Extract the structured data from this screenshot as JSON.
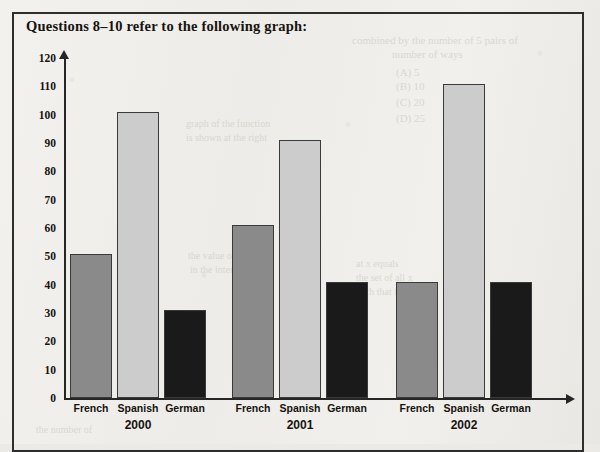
{
  "figure": {
    "title": "Questions 8–10 refer to the following graph:"
  },
  "bleed_text": [
    {
      "text": "combined by the number of 5 pairs of",
      "x": 352,
      "y": 34,
      "size": 11
    },
    {
      "text": "number of ways",
      "x": 392,
      "y": 48,
      "size": 11
    },
    {
      "text": "(A) 5",
      "x": 396,
      "y": 66,
      "size": 11
    },
    {
      "text": "(B) 10",
      "x": 396,
      "y": 80,
      "size": 11
    },
    {
      "text": "(C) 20",
      "x": 396,
      "y": 96,
      "size": 11
    },
    {
      "text": "(D) 25",
      "x": 396,
      "y": 112,
      "size": 11
    },
    {
      "text": "graph of the function",
      "x": 186,
      "y": 118,
      "size": 10
    },
    {
      "text": "is shown at the right",
      "x": 186,
      "y": 132,
      "size": 10
    },
    {
      "text": "the value of x",
      "x": 188,
      "y": 250,
      "size": 10
    },
    {
      "text": "in the interval",
      "x": 190,
      "y": 264,
      "size": 10
    },
    {
      "text": "at x equals",
      "x": 356,
      "y": 258,
      "size": 10
    },
    {
      "text": "the set of all x",
      "x": 356,
      "y": 272,
      "size": 10
    },
    {
      "text": "such that f of x",
      "x": 356,
      "y": 286,
      "size": 10
    },
    {
      "text": "the number of",
      "x": 36,
      "y": 424,
      "size": 10
    }
  ],
  "chart_data": {
    "type": "bar",
    "title": "",
    "xlabel": "",
    "ylabel": "",
    "ylim": [
      0,
      120
    ],
    "ytick_step": 10,
    "yticks": [
      120,
      110,
      100,
      90,
      80,
      70,
      60,
      50,
      40,
      30,
      20,
      10,
      0
    ],
    "grid": false,
    "legend_position": "none",
    "categories": [
      "2000",
      "2001",
      "2002"
    ],
    "series": [
      {
        "name": "French",
        "color": "#8a8a8a",
        "values": [
          51,
          61,
          41
        ]
      },
      {
        "name": "Spanish",
        "color": "#cccccc",
        "values": [
          101,
          91,
          111
        ]
      },
      {
        "name": "German",
        "color": "#1a1a1a",
        "values": [
          31,
          41,
          41
        ]
      }
    ],
    "groups": [
      {
        "year": "2000",
        "bars": [
          {
            "label": "French",
            "value": 51,
            "color": "#8a8a8a",
            "x": 70,
            "width": 42
          },
          {
            "label": "Spanish",
            "value": 101,
            "color": "#cccccc",
            "x": 117,
            "width": 42
          },
          {
            "label": "German",
            "value": 31,
            "color": "#1a1a1a",
            "x": 164,
            "width": 42
          }
        ]
      },
      {
        "year": "2001",
        "bars": [
          {
            "label": "French",
            "value": 61,
            "color": "#8a8a8a",
            "x": 232,
            "width": 42
          },
          {
            "label": "Spanish",
            "value": 91,
            "color": "#cccccc",
            "x": 279,
            "width": 42
          },
          {
            "label": "German",
            "value": 41,
            "color": "#1a1a1a",
            "x": 326,
            "width": 42
          }
        ]
      },
      {
        "year": "2002",
        "bars": [
          {
            "label": "French",
            "value": 41,
            "color": "#8a8a8a",
            "x": 396,
            "width": 42
          },
          {
            "label": "Spanish",
            "value": 111,
            "color": "#cccccc",
            "x": 443,
            "width": 42
          },
          {
            "label": "German",
            "value": 41,
            "color": "#1a1a1a",
            "x": 490,
            "width": 42
          }
        ]
      }
    ]
  },
  "geometry": {
    "baseline_y": 398,
    "top_y": 58,
    "axis_x": 64
  }
}
